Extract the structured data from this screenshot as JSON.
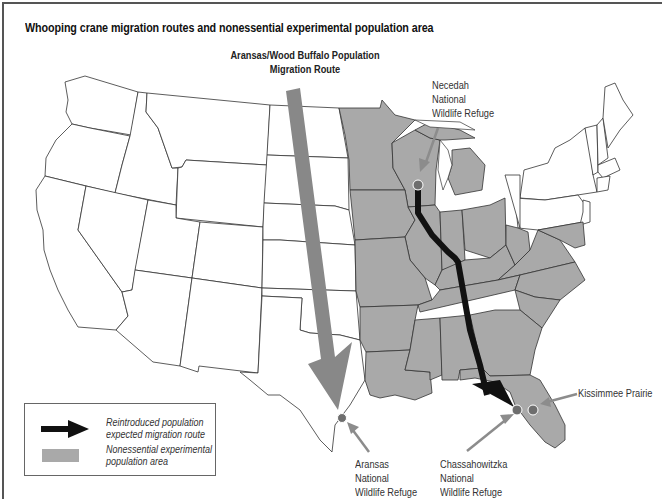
{
  "title": "Whooping crane migration routes and nonessential experimental population area",
  "labels": {
    "aransas_wood_buffalo_line1": "Aransas/Wood Buffalo Population",
    "aransas_wood_buffalo_line2": "Migration Route",
    "necedah_line1": "Necedah",
    "necedah_line2": "National",
    "necedah_line3": "Wildlife Refuge",
    "aransas_line1": "Aransas",
    "aransas_line2": "National",
    "aransas_line3": "Wildlife Refuge",
    "chassahowitzka_line1": "Chassahowitzka",
    "chassahowitzka_line2": "National",
    "chassahowitzka_line3": "Wildlife Refuge",
    "kissimmee": "Kissimmee Prairie"
  },
  "legend": {
    "items": [
      {
        "icon": "black-arrow",
        "line1": "Reintroduced population",
        "line2": "expected migration route"
      },
      {
        "icon": "gray-swatch",
        "line1": "Nonessential experimental",
        "line2": "population area"
      }
    ]
  },
  "colors": {
    "population_area": "#a9a9a9",
    "aransas_route_arrow": "#888888",
    "reintroduced_route": "#111111",
    "refuge_marker": "#6e6e6e",
    "pointer_arrow": "#8c8c8c",
    "state_line": "#333333"
  },
  "markers": [
    {
      "name": "Necedah National Wildlife Refuge",
      "x": 417,
      "y": 185
    },
    {
      "name": "Aransas National Wildlife Refuge",
      "x": 341,
      "y": 417
    },
    {
      "name": "Chassahowitzka National Wildlife Refuge",
      "x": 517,
      "y": 409
    },
    {
      "name": "Kissimmee Prairie",
      "x": 532,
      "y": 410
    }
  ]
}
